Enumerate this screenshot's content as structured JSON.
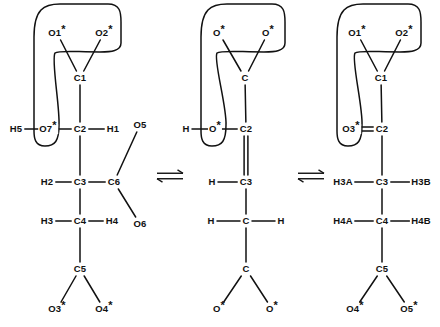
{
  "diagram": {
    "type": "chemical-structure-equilibrium",
    "background_color": "#ffffff",
    "line_color": "#111111",
    "text_color": "#111111",
    "operators": [
      {
        "name": "equilibrium-arrow-left",
        "glyph": "equilibrium",
        "x": 170,
        "y": 176
      },
      {
        "name": "equilibrium-arrow-right",
        "glyph": "equilibrium",
        "x": 311,
        "y": 176
      }
    ],
    "structures": [
      {
        "id": "structure-left",
        "name": "left-structure",
        "atoms": [
          {
            "id": "L_O1",
            "label": "O1",
            "star": true,
            "x": 57,
            "y": 33
          },
          {
            "id": "L_O2",
            "label": "O2",
            "star": true,
            "x": 104,
            "y": 33
          },
          {
            "id": "L_C1",
            "label": "C1",
            "star": false,
            "x": 80,
            "y": 78
          },
          {
            "id": "L_H5",
            "label": "H5",
            "star": false,
            "x": 16,
            "y": 129
          },
          {
            "id": "L_O7",
            "label": "O7",
            "star": true,
            "x": 48,
            "y": 129
          },
          {
            "id": "L_C2",
            "label": "C2",
            "star": false,
            "x": 80,
            "y": 129
          },
          {
            "id": "L_H1",
            "label": "H1",
            "star": false,
            "x": 113,
            "y": 129
          },
          {
            "id": "L_O5",
            "label": "O5",
            "star": false,
            "x": 140,
            "y": 125
          },
          {
            "id": "L_H2",
            "label": "H2",
            "star": false,
            "x": 47,
            "y": 182
          },
          {
            "id": "L_C3",
            "label": "C3",
            "star": false,
            "x": 80,
            "y": 182
          },
          {
            "id": "L_C6",
            "label": "C6",
            "star": false,
            "x": 114,
            "y": 182
          },
          {
            "id": "L_O6",
            "label": "O6",
            "star": false,
            "x": 140,
            "y": 224
          },
          {
            "id": "L_H3",
            "label": "H3",
            "star": false,
            "x": 47,
            "y": 221
          },
          {
            "id": "L_C4",
            "label": "C4",
            "star": false,
            "x": 80,
            "y": 221
          },
          {
            "id": "L_H4",
            "label": "H4",
            "star": false,
            "x": 112,
            "y": 221
          },
          {
            "id": "L_C5",
            "label": "C5",
            "star": false,
            "x": 80,
            "y": 269
          },
          {
            "id": "L_O3",
            "label": "O3",
            "star": true,
            "x": 57,
            "y": 309
          },
          {
            "id": "L_O4",
            "label": "O4",
            "star": true,
            "x": 104,
            "y": 309
          }
        ],
        "bonds": [
          {
            "from": "L_C1",
            "to": "L_O1",
            "order": 1
          },
          {
            "from": "L_C1",
            "to": "L_O2",
            "order": 1
          },
          {
            "from": "L_C1",
            "to": "L_C2",
            "order": 1
          },
          {
            "from": "L_H5",
            "to": "L_O7",
            "order": 1
          },
          {
            "from": "L_O7",
            "to": "L_C2",
            "order": 1
          },
          {
            "from": "L_C2",
            "to": "L_H1",
            "order": 1
          },
          {
            "from": "L_C2",
            "to": "L_C3",
            "order": 1
          },
          {
            "from": "L_H2",
            "to": "L_C3",
            "order": 1
          },
          {
            "from": "L_C3",
            "to": "L_C6",
            "order": 1
          },
          {
            "from": "L_C6",
            "to": "L_O5",
            "order": 1
          },
          {
            "from": "L_C6",
            "to": "L_O6",
            "order": 1
          },
          {
            "from": "L_C3",
            "to": "L_C4",
            "order": 1
          },
          {
            "from": "L_H3",
            "to": "L_C4",
            "order": 1
          },
          {
            "from": "L_C4",
            "to": "L_H4",
            "order": 1
          },
          {
            "from": "L_C4",
            "to": "L_C5",
            "order": 1
          },
          {
            "from": "L_C5",
            "to": "L_O3",
            "order": 1
          },
          {
            "from": "L_C5",
            "to": "L_O4",
            "order": 1
          }
        ],
        "enclosure": {
          "name": "chelate-ring-outline",
          "anchor_atoms": [
            "L_O1",
            "L_O2",
            "L_O7"
          ]
        }
      },
      {
        "id": "structure-middle",
        "name": "middle-structure",
        "atoms": [
          {
            "id": "M_O1",
            "label": "O",
            "star": true,
            "x": 219,
            "y": 33
          },
          {
            "id": "M_O2",
            "label": "O",
            "star": true,
            "x": 268,
            "y": 33
          },
          {
            "id": "M_C1",
            "label": "C",
            "star": false,
            "x": 245,
            "y": 78
          },
          {
            "id": "M_H",
            "label": "H",
            "star": false,
            "x": 186,
            "y": 129
          },
          {
            "id": "M_O7",
            "label": "O",
            "star": true,
            "x": 215,
            "y": 129
          },
          {
            "id": "M_C2",
            "label": "C2",
            "star": false,
            "x": 246,
            "y": 129
          },
          {
            "id": "M_H3",
            "label": "H",
            "star": false,
            "x": 212,
            "y": 182
          },
          {
            "id": "M_C3",
            "label": "C3",
            "star": false,
            "x": 246,
            "y": 182
          },
          {
            "id": "M_Ha",
            "label": "H",
            "star": false,
            "x": 211,
            "y": 221
          },
          {
            "id": "M_C4",
            "label": "C",
            "star": false,
            "x": 246,
            "y": 221
          },
          {
            "id": "M_Hb",
            "label": "H",
            "star": false,
            "x": 281,
            "y": 221
          },
          {
            "id": "M_C5",
            "label": "C",
            "star": false,
            "x": 246,
            "y": 269
          },
          {
            "id": "M_O3",
            "label": "O",
            "star": true,
            "x": 219,
            "y": 309
          },
          {
            "id": "M_O4",
            "label": "O",
            "star": true,
            "x": 272,
            "y": 309
          }
        ],
        "bonds": [
          {
            "from": "M_C1",
            "to": "M_O1",
            "order": 1
          },
          {
            "from": "M_C1",
            "to": "M_O2",
            "order": 1
          },
          {
            "from": "M_C1",
            "to": "M_C2",
            "order": 1
          },
          {
            "from": "M_H",
            "to": "M_O7",
            "order": 1
          },
          {
            "from": "M_O7",
            "to": "M_C2",
            "order": 1
          },
          {
            "from": "M_C2",
            "to": "M_C3",
            "order": 2
          },
          {
            "from": "M_H3",
            "to": "M_C3",
            "order": 1
          },
          {
            "from": "M_C3",
            "to": "M_C4",
            "order": 1
          },
          {
            "from": "M_Ha",
            "to": "M_C4",
            "order": 1
          },
          {
            "from": "M_C4",
            "to": "M_Hb",
            "order": 1
          },
          {
            "from": "M_C4",
            "to": "M_C5",
            "order": 1
          },
          {
            "from": "M_C5",
            "to": "M_O3",
            "order": 1
          },
          {
            "from": "M_C5",
            "to": "M_O4",
            "order": 1
          }
        ],
        "enclosure": {
          "name": "chelate-ring-outline",
          "anchor_atoms": [
            "M_O1",
            "M_O2",
            "M_O7"
          ]
        }
      },
      {
        "id": "structure-right",
        "name": "right-structure",
        "atoms": [
          {
            "id": "R_O1",
            "label": "O1",
            "star": true,
            "x": 357,
            "y": 33
          },
          {
            "id": "R_O2",
            "label": "O2",
            "star": true,
            "x": 404,
            "y": 33
          },
          {
            "id": "R_C1",
            "label": "C1",
            "star": false,
            "x": 381,
            "y": 78
          },
          {
            "id": "R_O3",
            "label": "O3",
            "star": true,
            "x": 351,
            "y": 129
          },
          {
            "id": "R_C2",
            "label": "C2",
            "star": false,
            "x": 382,
            "y": 129
          },
          {
            "id": "R_H3A",
            "label": "H3A",
            "star": false,
            "x": 343,
            "y": 182
          },
          {
            "id": "R_C3",
            "label": "C3",
            "star": false,
            "x": 382,
            "y": 182
          },
          {
            "id": "R_H3B",
            "label": "H3B",
            "star": false,
            "x": 421,
            "y": 182
          },
          {
            "id": "R_H4A",
            "label": "H4A",
            "star": false,
            "x": 343,
            "y": 221
          },
          {
            "id": "R_C4",
            "label": "C4",
            "star": false,
            "x": 382,
            "y": 221
          },
          {
            "id": "R_H4B",
            "label": "H4B",
            "star": false,
            "x": 421,
            "y": 221
          },
          {
            "id": "R_C5",
            "label": "C5",
            "star": false,
            "x": 382,
            "y": 269
          },
          {
            "id": "R_O4",
            "label": "O4",
            "star": true,
            "x": 355,
            "y": 309
          },
          {
            "id": "R_O5",
            "label": "O5",
            "star": true,
            "x": 409,
            "y": 309
          }
        ],
        "bonds": [
          {
            "from": "R_C1",
            "to": "R_O1",
            "order": 1
          },
          {
            "from": "R_C1",
            "to": "R_O2",
            "order": 1
          },
          {
            "from": "R_C1",
            "to": "R_C2",
            "order": 1
          },
          {
            "from": "R_O3",
            "to": "R_C2",
            "order": 2
          },
          {
            "from": "R_C2",
            "to": "R_C3",
            "order": 1
          },
          {
            "from": "R_H3A",
            "to": "R_C3",
            "order": 1
          },
          {
            "from": "R_C3",
            "to": "R_H3B",
            "order": 1
          },
          {
            "from": "R_C3",
            "to": "R_C4",
            "order": 1
          },
          {
            "from": "R_H4A",
            "to": "R_C4",
            "order": 1
          },
          {
            "from": "R_C4",
            "to": "R_H4B",
            "order": 1
          },
          {
            "from": "R_C4",
            "to": "R_C5",
            "order": 1
          },
          {
            "from": "R_C5",
            "to": "R_O4",
            "order": 1
          },
          {
            "from": "R_C5",
            "to": "R_O5",
            "order": 1
          }
        ],
        "enclosure": {
          "name": "chelate-ring-outline",
          "anchor_atoms": [
            "R_O1",
            "R_O2",
            "R_O3"
          ]
        }
      }
    ]
  }
}
